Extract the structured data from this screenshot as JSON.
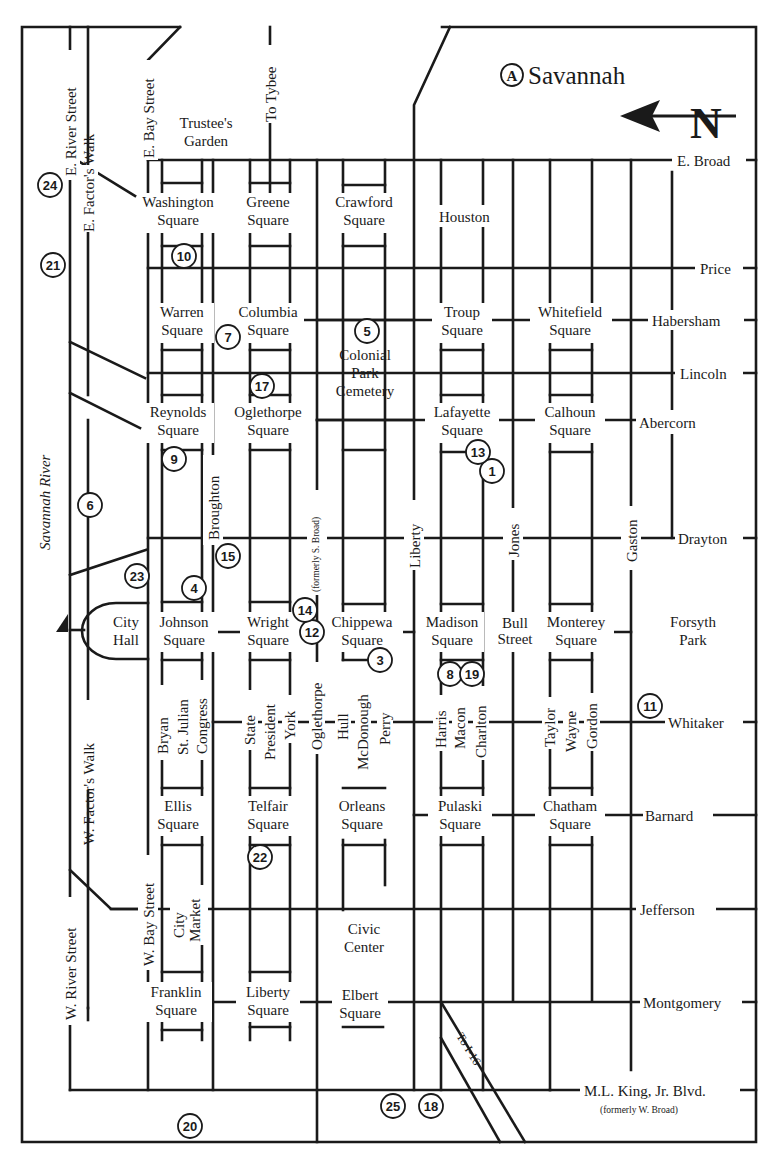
{
  "map": {
    "title": "Savannah",
    "title_badge": "A",
    "north_label": "N",
    "colors": {
      "ink": "#1a1a1a",
      "paper": "#ffffff"
    },
    "water": {
      "name": "Savannah River"
    },
    "streets_east_west_top_to_bottom": [
      {
        "name": "E. Broad"
      },
      {
        "name": "Price"
      },
      {
        "name": "Habersham"
      },
      {
        "name": "Lincoln"
      },
      {
        "name": "Abercorn"
      },
      {
        "name": "Drayton"
      },
      {
        "name": "Bull Street"
      },
      {
        "name": "Whitaker"
      },
      {
        "name": "Barnard"
      },
      {
        "name": "Jefferson"
      },
      {
        "name": "Montgomery"
      },
      {
        "name": "M.L. King, Jr. Blvd.",
        "note": "(formerly W. Broad)"
      }
    ],
    "streets_north_south": [
      {
        "name": "E. River Street"
      },
      {
        "name": "E. Factor's Walk"
      },
      {
        "name": "E. Bay Street"
      },
      {
        "name": "To Tybee"
      },
      {
        "name": "Houston"
      },
      {
        "name": "Broughton"
      },
      {
        "name": "Oglethorpe",
        "note": "(formerly S. Broad)"
      },
      {
        "name": "Liberty"
      },
      {
        "name": "Jones"
      },
      {
        "name": "Gaston"
      },
      {
        "name": "W. River Street"
      },
      {
        "name": "W. Factor's Walk"
      },
      {
        "name": "W. Bay Street"
      },
      {
        "name": "Bryan"
      },
      {
        "name": "St. Julian"
      },
      {
        "name": "Congress"
      },
      {
        "name": "State"
      },
      {
        "name": "President"
      },
      {
        "name": "York"
      },
      {
        "name": "Hull"
      },
      {
        "name": "McDonough"
      },
      {
        "name": "Perry"
      },
      {
        "name": "Harris"
      },
      {
        "name": "Macon"
      },
      {
        "name": "Charlton"
      },
      {
        "name": "Taylor"
      },
      {
        "name": "Wayne"
      },
      {
        "name": "Gordon"
      },
      {
        "name": "To I-16"
      }
    ],
    "squares": [
      {
        "line1": "Washington",
        "line2": "Square"
      },
      {
        "line1": "Greene",
        "line2": "Square"
      },
      {
        "line1": "Crawford",
        "line2": "Square"
      },
      {
        "line1": "Warren",
        "line2": "Square"
      },
      {
        "line1": "Columbia",
        "line2": "Square"
      },
      {
        "line1": "Troup",
        "line2": "Square"
      },
      {
        "line1": "Whitefield",
        "line2": "Square"
      },
      {
        "line1": "Reynolds",
        "line2": "Square"
      },
      {
        "line1": "Oglethorpe",
        "line2": "Square"
      },
      {
        "line1": "Lafayette",
        "line2": "Square"
      },
      {
        "line1": "Calhoun",
        "line2": "Square"
      },
      {
        "line1": "Johnson",
        "line2": "Square"
      },
      {
        "line1": "Wright",
        "line2": "Square"
      },
      {
        "line1": "Chippewa",
        "line2": "Square"
      },
      {
        "line1": "Madison",
        "line2": "Square"
      },
      {
        "line1": "Monterey",
        "line2": "Square"
      },
      {
        "line1": "Ellis",
        "line2": "Square"
      },
      {
        "line1": "Telfair",
        "line2": "Square"
      },
      {
        "line1": "Orleans",
        "line2": "Square"
      },
      {
        "line1": "Pulaski",
        "line2": "Square"
      },
      {
        "line1": "Chatham",
        "line2": "Square"
      },
      {
        "line1": "Franklin",
        "line2": "Square"
      },
      {
        "line1": "Liberty",
        "line2": "Square"
      },
      {
        "line1": "Elbert",
        "line2": "Square"
      }
    ],
    "landmarks": [
      {
        "line1": "Trustee's",
        "line2": "Garden"
      },
      {
        "line1": "Colonial",
        "line2": "Park",
        "line3": "Cemetery"
      },
      {
        "line1": "City",
        "line2": "Hall"
      },
      {
        "line1": "Forsyth",
        "line2": "Park"
      },
      {
        "line1": "City",
        "line2": "Market"
      },
      {
        "line1": "Civic",
        "line2": "Center"
      }
    ],
    "markers": [
      {
        "num": "1"
      },
      {
        "num": "3"
      },
      {
        "num": "4"
      },
      {
        "num": "5"
      },
      {
        "num": "6"
      },
      {
        "num": "7"
      },
      {
        "num": "8"
      },
      {
        "num": "9"
      },
      {
        "num": "10"
      },
      {
        "num": "11"
      },
      {
        "num": "12"
      },
      {
        "num": "13"
      },
      {
        "num": "14"
      },
      {
        "num": "15"
      },
      {
        "num": "17"
      },
      {
        "num": "18"
      },
      {
        "num": "19"
      },
      {
        "num": "20"
      },
      {
        "num": "21"
      },
      {
        "num": "22"
      },
      {
        "num": "23"
      },
      {
        "num": "24"
      },
      {
        "num": "25"
      }
    ]
  }
}
